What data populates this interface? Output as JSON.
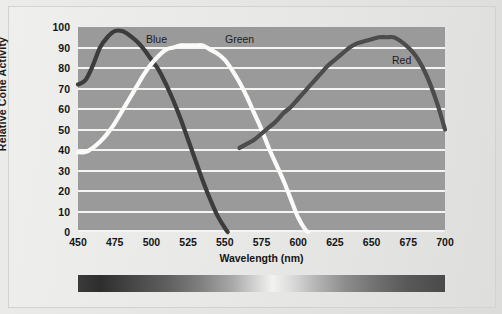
{
  "chart_data": {
    "type": "line",
    "title": "",
    "xlabel": "Wavelength (nm)",
    "ylabel": "Relative Cone Activity",
    "xlim": [
      450,
      700
    ],
    "ylim": [
      0,
      100
    ],
    "xticks": [
      "450",
      "475",
      "500",
      "525",
      "550",
      "575",
      "600",
      "625",
      "650",
      "675",
      "700"
    ],
    "yticks": [
      "100",
      "90",
      "80",
      "70",
      "60",
      "50",
      "40",
      "30",
      "20",
      "10",
      "0"
    ],
    "grid": "horizontal",
    "legend_position": "inline-labels",
    "series": [
      {
        "name": "Blue",
        "label": "Blue",
        "color": "#3c3c3c",
        "peak_x": 478,
        "peak_y": 98,
        "x": [
          450,
          455,
          460,
          465,
          470,
          475,
          480,
          485,
          490,
          495,
          500,
          505,
          510,
          515,
          520,
          525,
          530,
          535,
          540,
          545,
          550,
          552
        ],
        "values": [
          72,
          74,
          81,
          90,
          95,
          98,
          98,
          96,
          93,
          89,
          84,
          79,
          72,
          64,
          55,
          45,
          35,
          25,
          16,
          8,
          2,
          0
        ]
      },
      {
        "name": "Green",
        "label": "Green",
        "color": "#fbfbf9",
        "peak_x": 533,
        "peak_y": 91,
        "x": [
          450,
          455,
          460,
          465,
          470,
          475,
          480,
          485,
          490,
          495,
          500,
          505,
          510,
          515,
          520,
          525,
          530,
          535,
          540,
          545,
          550,
          555,
          560,
          565,
          570,
          575,
          580,
          585,
          590,
          595,
          600,
          605,
          607
        ],
        "values": [
          39,
          39,
          41,
          44,
          48,
          53,
          59,
          65,
          71,
          77,
          82,
          86,
          89,
          90,
          91,
          91,
          91,
          91,
          89,
          87,
          84,
          79,
          73,
          66,
          58,
          50,
          41,
          33,
          25,
          16,
          7,
          1,
          0
        ]
      },
      {
        "name": "Red",
        "label": "Red",
        "color": "#4c4c4c",
        "peak_x": 663,
        "peak_y": 95,
        "x": [
          560,
          565,
          570,
          575,
          580,
          585,
          590,
          595,
          600,
          605,
          610,
          615,
          620,
          625,
          630,
          635,
          640,
          645,
          650,
          655,
          660,
          665,
          670,
          675,
          680,
          685,
          690,
          695,
          700
        ],
        "values": [
          41,
          43,
          45,
          48,
          51,
          54,
          58,
          61,
          65,
          69,
          73,
          77,
          81,
          84,
          87,
          90,
          92,
          93,
          94,
          95,
          95,
          95,
          93,
          90,
          86,
          80,
          72,
          62,
          50
        ]
      }
    ],
    "spectrum_bar": {
      "name": "visible-spectrum-bar",
      "from": "450",
      "to": "700"
    }
  }
}
